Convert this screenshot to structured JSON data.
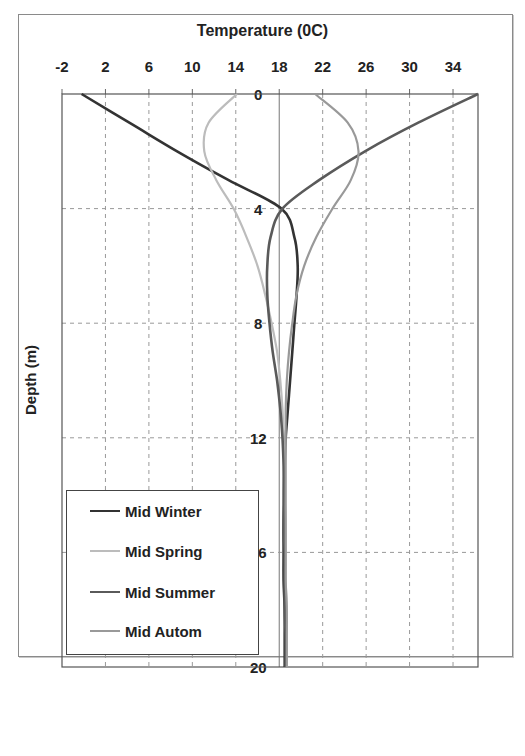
{
  "chart_data": {
    "type": "line",
    "orientation": "depth-profile (x = temperature, y = depth, y inverted)",
    "title": "Temperature (0C)",
    "xlabel": "Temperature (0C)",
    "ylabel": "Depth (m)",
    "xlim": [
      -2,
      36.3
    ],
    "ylim": [
      0,
      20
    ],
    "x_ticks": [
      "-2",
      "2",
      "6",
      "10",
      "14",
      "18",
      "22",
      "26",
      "30",
      "34"
    ],
    "y_ticks": [
      "0",
      "4",
      "8",
      "12",
      "16",
      "20"
    ],
    "grid": "dashed",
    "legend_position": "lower-left inside plot",
    "depth": [
      0,
      1,
      2,
      3,
      4,
      5,
      6,
      7,
      8,
      9,
      10,
      11,
      12,
      13,
      14,
      15,
      16,
      17,
      18,
      19,
      20
    ],
    "series": [
      {
        "name": "Mid Winter",
        "color": "#333333",
        "values": [
          -0.2,
          4.2,
          8.6,
          13.3,
          18.2,
          19.4,
          19.7,
          19.6,
          19.4,
          19.2,
          19.0,
          18.8,
          18.6,
          18.5,
          18.5,
          18.4,
          18.4,
          18.4,
          18.5,
          18.5,
          18.5
        ]
      },
      {
        "name": "Mid Spring",
        "color": "#bcbcbc",
        "values": [
          14.1,
          11.5,
          11.1,
          12.2,
          13.8,
          15.0,
          16.0,
          16.7,
          17.3,
          17.8,
          18.1,
          18.3,
          18.4,
          18.5,
          18.5,
          18.6,
          18.6,
          18.6,
          18.7,
          18.7,
          18.7
        ]
      },
      {
        "name": "Mid Summer",
        "color": "#5a5a5a",
        "values": [
          36.3,
          30.8,
          25.9,
          21.7,
          18.3,
          17.2,
          16.9,
          16.9,
          17.1,
          17.4,
          17.8,
          18.1,
          18.3,
          18.4,
          18.4,
          18.4,
          18.5,
          18.5,
          18.5,
          18.6,
          18.6
        ]
      },
      {
        "name": "Mid Autom",
        "color": "#999999",
        "values": [
          21.3,
          24.3,
          25.3,
          24.6,
          22.9,
          21.4,
          20.3,
          19.6,
          19.2,
          18.9,
          18.7,
          18.6,
          18.6,
          18.6,
          18.6,
          18.6,
          18.6,
          18.6,
          18.7,
          18.7,
          18.7
        ]
      }
    ]
  },
  "labels": {
    "title": "Temperature (0C)",
    "ylabel": "Depth (m)"
  },
  "legend": [
    {
      "label": "Mid Winter",
      "color": "#333333"
    },
    {
      "label": "Mid Spring",
      "color": "#bcbcbc"
    },
    {
      "label": "Mid Summer",
      "color": "#5a5a5a"
    },
    {
      "label": "Mid Autom",
      "color": "#999999"
    }
  ]
}
